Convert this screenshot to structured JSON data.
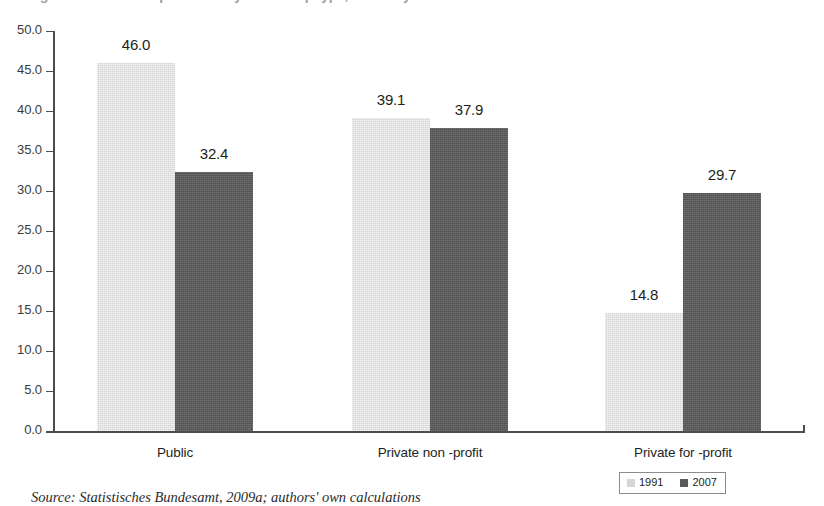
{
  "title_strip": {
    "text": "Figure: Share of hospital beds by ownership type, Germany"
  },
  "source": {
    "text": "Source: Statistisches Bundesamt, 2009a; authors' own calculations"
  },
  "legend": {
    "entries": [
      {
        "label": "1991",
        "swatch": "light",
        "color": "#d6d6d6"
      },
      {
        "label": "2007",
        "swatch": "dark",
        "color": "#5a5a5a"
      }
    ]
  },
  "axis": {
    "y_ticks": [
      "50.0",
      "45.0",
      "40.0",
      "35.0",
      "30.0",
      "25.0",
      "20.0",
      "15.0",
      "10.0",
      "5.0",
      "0.0"
    ]
  },
  "chart_data": {
    "type": "bar",
    "title": "",
    "xlabel": "",
    "ylabel": "",
    "ylim": [
      0,
      50
    ],
    "ytick_step": 5,
    "grid": false,
    "legend_position": "bottom-right",
    "categories": [
      "Public",
      "Private non -profit",
      "Private for -profit"
    ],
    "series": [
      {
        "name": "1991",
        "color": "#d6d6d6",
        "values": [
          46.0,
          39.1,
          14.8
        ]
      },
      {
        "name": "2007",
        "color": "#5a5a5a",
        "values": [
          32.4,
          37.9,
          29.7
        ]
      }
    ],
    "value_labels": [
      [
        "46.0",
        "39.1",
        "14.8"
      ],
      [
        "32.4",
        "37.9",
        "29.7"
      ]
    ]
  },
  "colors": {
    "series_1991": "#d6d6d6",
    "series_2007": "#5a5a5a",
    "axis": "#4d4d4d",
    "text": "#231f20",
    "background": "#ffffff"
  }
}
